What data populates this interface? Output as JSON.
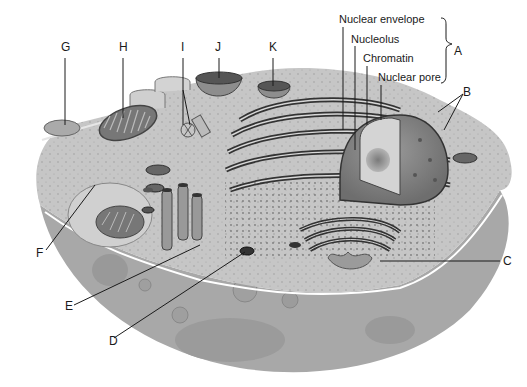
{
  "diagram": {
    "type": "animal-cell-cutaway",
    "nucleus_labels": {
      "nuclear_envelope": "Nuclear envelope",
      "nucleolus": "Nucleolus",
      "chromatin": "Chromatin",
      "nuclear_pore": "Nuclear pore",
      "group_letter": "A"
    },
    "letters": {
      "A": "A",
      "B": "B",
      "C": "C",
      "D": "D",
      "E": "E",
      "F": "F",
      "G": "G",
      "H": "H",
      "I": "I",
      "J": "J",
      "K": "K"
    },
    "colors": {
      "background": "#ffffff",
      "cell_fill": "#bdbdbd",
      "cytoplasm": "#c9c9c9",
      "lower_cut": "#a9a9a9",
      "organelle_dark": "#4a4a4a",
      "membrane_highlight": "#ffffff",
      "line": "#1a1a1a"
    }
  }
}
